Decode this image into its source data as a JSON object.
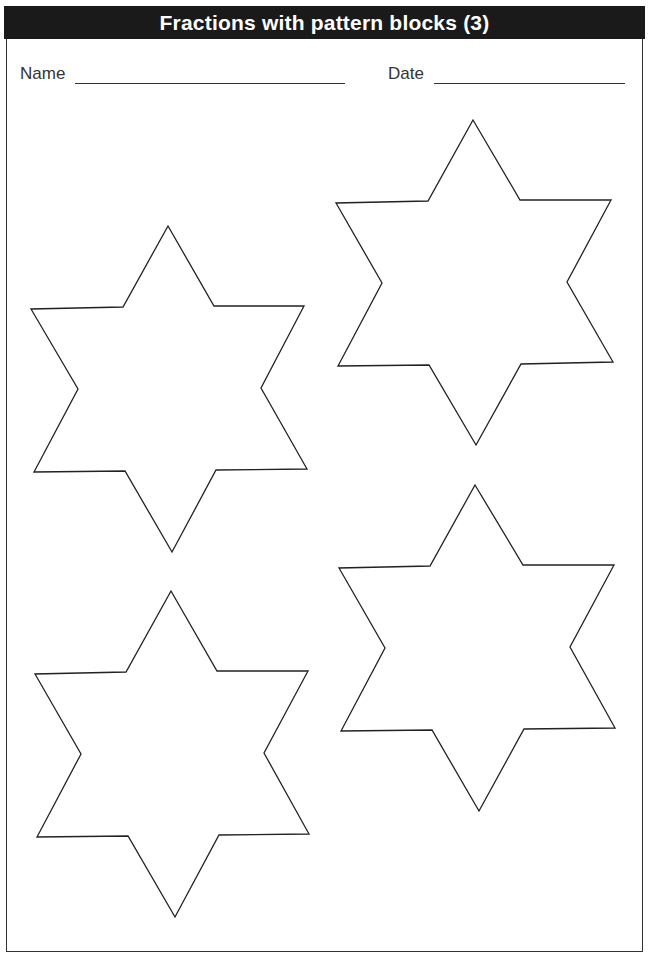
{
  "header": {
    "title": "Fractions with pattern blocks (3)"
  },
  "fields": {
    "name_label": "Name",
    "date_label": "Date"
  },
  "stars": [
    {
      "id": "star-1",
      "points": "168,226 214,306 304,306 261,388 307,469 216,470 172,552 125,471 34,472 78,389 31,309 123,307"
    },
    {
      "id": "star-2",
      "points": "473,120 520,200 611,200 567,282 613,362 521,364 476,445 429,365 338,366 382,283 336,203 428,201"
    },
    {
      "id": "star-3",
      "points": "171,591 217,671 308,671 264,753 309,834 219,835 175,917 128,836 37,837 81,754 35,674 126,672"
    },
    {
      "id": "star-4",
      "points": "475,485 523,565 614,565 570,647 615,728 524,729 479,811 432,730 341,731 385,648 339,568 430,566"
    }
  ],
  "colors": {
    "header_bg": "#1a1a1a",
    "line": "#333333"
  }
}
